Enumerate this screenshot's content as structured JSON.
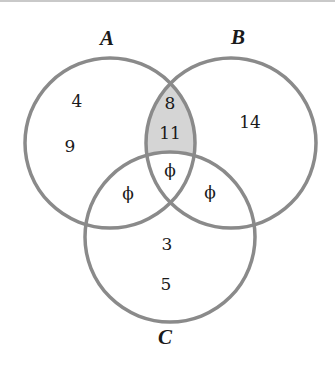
{
  "diagram": {
    "type": "venn",
    "sets": [
      {
        "name": "A",
        "label": "A"
      },
      {
        "name": "B",
        "label": "B"
      },
      {
        "name": "C",
        "label": "C"
      }
    ],
    "regions": {
      "A_only": [
        "4",
        "9"
      ],
      "B_only": [
        "14"
      ],
      "C_only": [
        "3",
        "5"
      ],
      "A_and_B_only": [
        "8",
        "11"
      ],
      "A_and_C_only": [
        "ϕ"
      ],
      "B_and_C_only": [
        "ϕ"
      ],
      "A_and_B_and_C": [
        "ϕ"
      ]
    },
    "shaded_region": "A ∩ B − C",
    "colors": {
      "circle_stroke": "#8a8a8a",
      "shade_fill": "#d5d5d5",
      "text": "#1a1a1a",
      "background": "#ffffff"
    }
  }
}
